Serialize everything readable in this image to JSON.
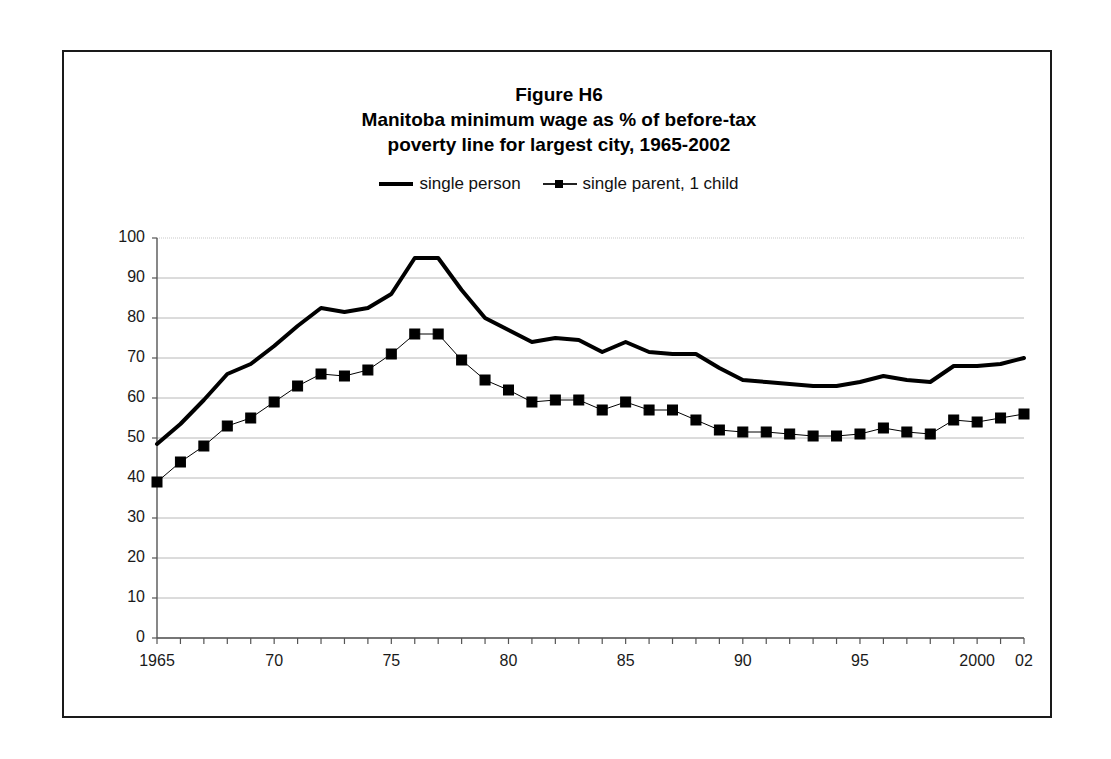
{
  "figure": {
    "title_lines": [
      "Figure H6",
      "Manitoba minimum wage as % of before-tax",
      "poverty line for largest city, 1965-2002"
    ]
  },
  "legend": {
    "position": "top-center",
    "entries": [
      {
        "label": "single person",
        "style": "solid-thick-line",
        "color": "#000000"
      },
      {
        "label": "single parent, 1 child",
        "style": "thin-line-square-markers",
        "color": "#000000"
      }
    ]
  },
  "axes": {
    "y_ticks": [
      "0",
      "10",
      "20",
      "30",
      "40",
      "50",
      "60",
      "70",
      "80",
      "90",
      "100"
    ],
    "x_ticks_labeled": [
      "1965",
      "70",
      "75",
      "80",
      "85",
      "90",
      "95",
      "2000",
      "02"
    ]
  },
  "chart_data": {
    "type": "line",
    "xlabel": "",
    "ylabel": "",
    "ylim": [
      0,
      100
    ],
    "xlim": [
      1965,
      2002
    ],
    "ytick_step": 10,
    "grid": true,
    "grid_axis": "y",
    "legend_position": "top-center",
    "x": [
      1965,
      1966,
      1967,
      1968,
      1969,
      1970,
      1971,
      1972,
      1973,
      1974,
      1975,
      1976,
      1977,
      1978,
      1979,
      1980,
      1981,
      1982,
      1983,
      1984,
      1985,
      1986,
      1987,
      1988,
      1989,
      1990,
      1991,
      1992,
      1993,
      1994,
      1995,
      1996,
      1997,
      1998,
      1999,
      2000,
      2001,
      2002
    ],
    "x_labels": [
      "1965",
      "66",
      "67",
      "68",
      "69",
      "70",
      "71",
      "72",
      "73",
      "74",
      "75",
      "76",
      "77",
      "78",
      "79",
      "80",
      "81",
      "82",
      "83",
      "84",
      "85",
      "86",
      "87",
      "88",
      "89",
      "90",
      "91",
      "92",
      "93",
      "94",
      "95",
      "96",
      "97",
      "98",
      "99",
      "2000",
      "01",
      "02"
    ],
    "series": [
      {
        "name": "single person",
        "marker": "none",
        "line_width": 4,
        "color": "#000000",
        "values": [
          48.5,
          53.5,
          59.5,
          66.0,
          68.5,
          73.0,
          78.0,
          82.5,
          81.5,
          82.5,
          86.0,
          95.0,
          95.0,
          87.0,
          80.0,
          77.0,
          74.0,
          75.0,
          74.5,
          71.5,
          74.0,
          71.5,
          71.0,
          71.0,
          67.5,
          64.5,
          64.0,
          63.5,
          63.0,
          63.0,
          64.0,
          65.5,
          64.5,
          64.0,
          68.0,
          68.0,
          68.5,
          70.0
        ]
      },
      {
        "name": "single parent, 1 child",
        "marker": "square",
        "line_width": 1,
        "color": "#000000",
        "values": [
          39.0,
          44.0,
          48.0,
          53.0,
          55.0,
          59.0,
          63.0,
          66.0,
          65.5,
          67.0,
          71.0,
          76.0,
          76.0,
          69.5,
          64.5,
          62.0,
          59.0,
          59.5,
          59.5,
          57.0,
          59.0,
          57.0,
          57.0,
          54.5,
          52.0,
          51.5,
          51.5,
          51.0,
          50.5,
          50.5,
          51.0,
          52.5,
          51.5,
          51.0,
          54.5,
          54.0,
          55.0,
          56.0
        ]
      }
    ]
  }
}
